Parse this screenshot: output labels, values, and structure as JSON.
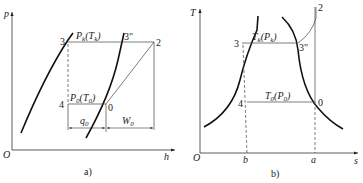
{
  "diagram_a": {
    "caption": "a)",
    "y_axis": "p",
    "x_axis": "h",
    "origin": "O",
    "points": {
      "p3": "3",
      "p3pp": "3\"",
      "p2": "2",
      "p4": "4",
      "p0": "0"
    },
    "labels": {
      "high_line_main": "P",
      "high_line_sub": "k",
      "high_line_paren": "(T",
      "high_line_paren_sub": "k",
      "high_line_close": ")",
      "low_line_main": "P",
      "low_line_sub": "0",
      "low_line_paren": "(T",
      "low_line_paren_sub": "0",
      "low_line_close": ")",
      "q_main": "q",
      "q_sub": "0",
      "w_main": "W",
      "w_sub": "0"
    }
  },
  "diagram_b": {
    "caption": "b)",
    "y_axis": "T",
    "x_axis": "s",
    "origin": "O",
    "x_marks": {
      "b": "b",
      "a": "a"
    },
    "points": {
      "p3": "3",
      "p3pp": "3\"",
      "p2": "2",
      "p4": "4",
      "p0": "0"
    },
    "labels": {
      "high_line_main": "T",
      "high_line_sub": "k",
      "high_line_paren": "(P",
      "high_line_paren_sub": "k",
      "high_line_close": ")",
      "low_line_main": "T",
      "low_line_sub": "0",
      "low_line_paren": "(P",
      "low_line_paren_sub": "0",
      "low_line_close": ")"
    }
  }
}
